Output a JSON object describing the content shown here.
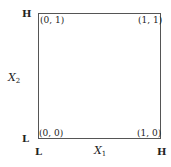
{
  "diagram": {
    "type": "2x2 factorial design square",
    "corners": {
      "top_left": "(0, 1)",
      "top_right": "(1, 1)",
      "bottom_left": "(0, 0)",
      "bottom_right": "(1, 0)"
    },
    "y_axis": {
      "name": "X",
      "subscript": "2",
      "high_label": "H",
      "low_label": "L"
    },
    "x_axis": {
      "name": "X",
      "subscript": "1",
      "low_label": "L",
      "high_label": "H"
    }
  }
}
